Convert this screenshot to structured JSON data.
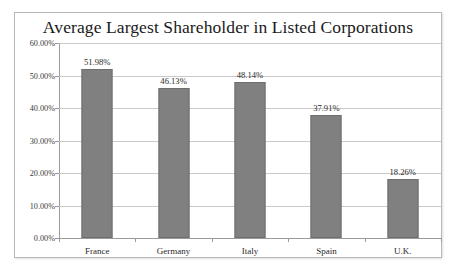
{
  "chart_data": {
    "type": "bar",
    "title": "Average Largest Shareholder in Listed Corporations",
    "xlabel": "",
    "ylabel": "",
    "categories": [
      "France",
      "Germany",
      "Italy",
      "Spain",
      "U.K."
    ],
    "values": [
      51.98,
      46.13,
      48.14,
      37.91,
      18.26
    ],
    "value_labels": [
      "51.98%",
      "46.13%",
      "48.14%",
      "37.91%",
      "18.26%"
    ],
    "ylim": [
      0,
      60
    ],
    "y_tick_values": [
      0,
      10,
      20,
      30,
      40,
      50,
      60
    ],
    "y_tick_labels": [
      "0.00%",
      "10.00%",
      "20.00%",
      "30.00%",
      "40.00%",
      "50.00%",
      "60.00%"
    ],
    "grid": true,
    "legend": false,
    "series": [
      {
        "name": "Average Largest Shareholder",
        "values": [
          51.98,
          46.13,
          48.14,
          37.91,
          18.26
        ]
      }
    ],
    "colors": {
      "bar_fill": "#808080",
      "bar_border": "#6e6e6e",
      "gridline": "#c9c9c9",
      "axis": "#9a9a9a",
      "text": "#2a2a2a",
      "title": "#1a1a1a",
      "plot_background": "#ffffff",
      "frame_border": "#b8b8b8"
    }
  }
}
